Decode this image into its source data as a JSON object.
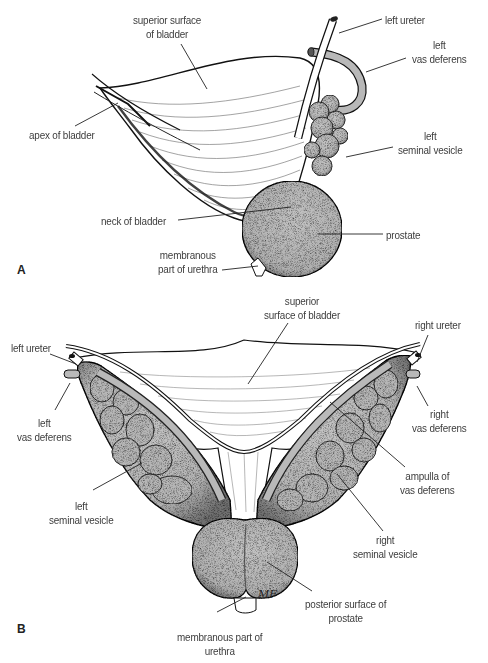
{
  "figure": {
    "panels": [
      {
        "id": "A",
        "letter": "A",
        "view": "lateral view of bladder and accessory glands",
        "labels": {
          "superior_surface": [
            "superior surface",
            "of bladder"
          ],
          "left_ureter": [
            "left ureter"
          ],
          "left_vas_deferens": [
            "left",
            "vas deferens"
          ],
          "apex": [
            "apex of bladder"
          ],
          "left_seminal_vesicle": [
            "left",
            "seminal vesicle"
          ],
          "neck": [
            "neck of bladder"
          ],
          "prostate": [
            "prostate"
          ],
          "membranous_urethra": [
            "membranous",
            "part of urethra"
          ]
        }
      },
      {
        "id": "B",
        "letter": "B",
        "view": "posterior view of bladder, seminal vesicles and prostate",
        "labels": {
          "superior_surface": [
            "superior",
            "surface of bladder"
          ],
          "left_ureter": [
            "left ureter"
          ],
          "right_ureter": [
            "right ureter"
          ],
          "left_vas_deferens": [
            "left",
            "vas deferens"
          ],
          "right_vas_deferens": [
            "right",
            "vas deferens"
          ],
          "ampulla": [
            "ampulla of",
            "vas deferens"
          ],
          "left_seminal_vesicle": [
            "left",
            "seminal vesicle"
          ],
          "right_seminal_vesicle": [
            "right",
            "seminal vesicle"
          ],
          "posterior_prostate": [
            "posterior surface of",
            "prostate"
          ],
          "membranous_urethra": [
            "membranous part of",
            "urethra"
          ],
          "signature": "MF"
        }
      }
    ],
    "colors": {
      "gland_fill": "#b9b9b9",
      "gland_dark": "#8a8a8a",
      "outline": "#1a1a1a",
      "bladder_fill": "#ffffff",
      "label_text": "#3d3d3d",
      "leader_line": "#222222"
    }
  }
}
